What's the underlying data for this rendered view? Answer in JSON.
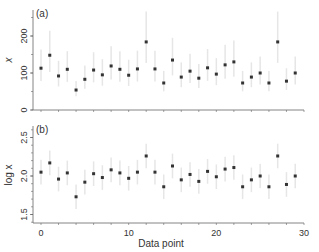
{
  "chart_data": [
    {
      "type": "scatter",
      "panel_label": "(a)",
      "title": "",
      "xlabel": "",
      "ylabel": "x",
      "ylim": [
        0,
        270
      ],
      "yticks": [
        0,
        100,
        200
      ],
      "xlim": [
        -1.5,
        30
      ],
      "xticks": [
        0,
        10,
        20,
        30
      ],
      "x": [
        0,
        1,
        2,
        3,
        4,
        5,
        6,
        7,
        8,
        9,
        10,
        11,
        12,
        13,
        14,
        15,
        16,
        17,
        18,
        19,
        20,
        21,
        22,
        23,
        24,
        25,
        26,
        27,
        28,
        29
      ],
      "values": [
        113,
        148,
        92,
        110,
        54,
        83,
        108,
        95,
        119,
        110,
        94,
        111,
        184,
        111,
        73,
        135,
        89,
        105,
        86,
        114,
        97,
        122,
        130,
        73,
        89,
        100,
        73,
        184,
        78,
        100
      ],
      "error_bars": "multiplicative, approx log10 ±0.16",
      "grid": false
    },
    {
      "type": "scatter",
      "panel_label": "(b)",
      "title": "",
      "xlabel": "Data point",
      "ylabel": "log x",
      "ylim": [
        1.38,
        2.62
      ],
      "yticks": [
        1.5,
        2.0,
        2.5
      ],
      "xlim": [
        -1.5,
        30
      ],
      "xticks": [
        0,
        10,
        20,
        30
      ],
      "x": [
        0,
        1,
        2,
        3,
        4,
        5,
        6,
        7,
        8,
        9,
        10,
        11,
        12,
        13,
        14,
        15,
        16,
        17,
        18,
        19,
        20,
        21,
        22,
        23,
        24,
        25,
        26,
        27,
        28,
        29
      ],
      "values": [
        2.05,
        2.17,
        1.96,
        2.04,
        1.73,
        1.92,
        2.03,
        1.98,
        2.08,
        2.04,
        1.97,
        2.05,
        2.26,
        2.05,
        1.86,
        2.13,
        1.95,
        2.02,
        1.93,
        2.06,
        1.99,
        2.09,
        2.11,
        1.86,
        1.95,
        2.0,
        1.86,
        2.26,
        1.89,
        2.0
      ],
      "error_bars": "approx ±0.16",
      "grid": false
    }
  ],
  "labels": {
    "panel_a": "(a)",
    "panel_b": "(b)",
    "ylabel_a": "x",
    "ylabel_b": "log x",
    "xlabel": "Data point",
    "ytick_a": [
      "0",
      "100",
      "200"
    ],
    "ytick_b": [
      "1.5",
      "2.0",
      "2.5"
    ],
    "xtick": [
      "0",
      "10",
      "20",
      "30"
    ]
  },
  "colors": {
    "point": "#333333",
    "errorbar": "#e6e6e6",
    "axis": "#666666"
  }
}
